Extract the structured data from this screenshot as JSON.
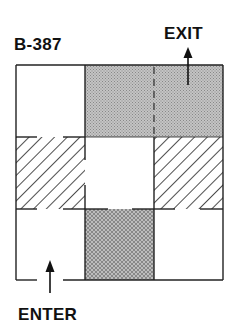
{
  "diagram": {
    "title": "B-387",
    "exit_label": "EXIT",
    "enter_label": "ENTER",
    "grid": {
      "rows": 3,
      "cols": 3,
      "cells": [
        [
          "open",
          "dotted",
          "dotted"
        ],
        [
          "hatched",
          "open",
          "hatched"
        ],
        [
          "open",
          "crosshatch",
          "open"
        ]
      ]
    },
    "colors": {
      "line": "#222222",
      "dotted_fill": "#b8b8b8",
      "crosshatch_fill": "#a8a8a8",
      "hatch_stroke": "#222222",
      "background": "#ffffff"
    }
  }
}
